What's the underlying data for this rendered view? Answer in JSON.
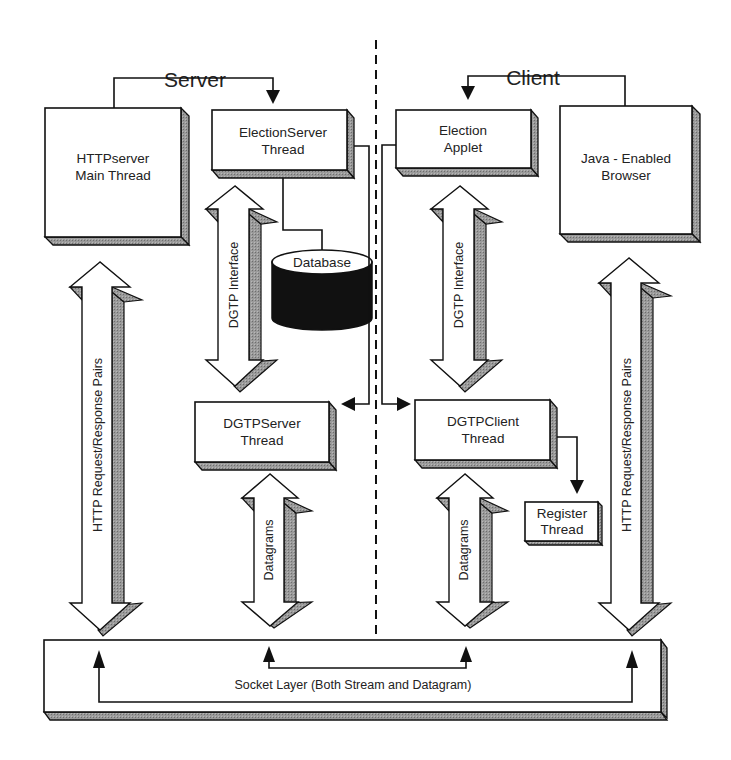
{
  "sections": {
    "server_title": "Server",
    "client_title": "Client"
  },
  "boxes": {
    "httpserver": [
      "HTTPserver",
      "Main Thread"
    ],
    "election_server": [
      "ElectionServer",
      "Thread"
    ],
    "election_applet": [
      "Election",
      "Applet"
    ],
    "browser": [
      "Java - Enabled",
      "Browser"
    ],
    "dgtp_server": [
      "DGTPServer",
      "Thread"
    ],
    "dgtp_client": [
      "DGTPClient",
      "Thread"
    ],
    "register": [
      "Register",
      "Thread"
    ],
    "database": "Database",
    "socket_layer": "Socket Layer (Both Stream and Datagram)"
  },
  "arrows": {
    "http_left": "HTTP Request/Response Pairs",
    "http_right": "HTTP Request/Response Pairs",
    "dgtp_interface_server": "DGTP Interface",
    "dgtp_interface_client": "DGTP Interface",
    "datagrams_server": "Datagrams",
    "datagrams_client": "Datagrams"
  },
  "colors": {
    "stroke": "#1a1a1a",
    "shadow": "#8c8c8c",
    "fill": "#ffffff",
    "database": "#111111"
  }
}
